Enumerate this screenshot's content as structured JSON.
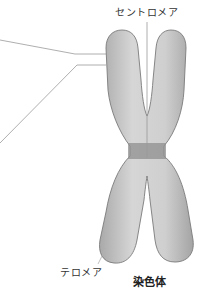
{
  "diagram": {
    "title": "染色体",
    "labels": {
      "centromere": "セントロメア",
      "telomere": "テロメア"
    },
    "colors": {
      "chromatid_fill": "#c8c8c8",
      "chromatid_stroke": "#7a7a7a",
      "centromere_band": "#8f8f8f",
      "leader_line": "#9a9a9a",
      "text": "#333333"
    }
  }
}
